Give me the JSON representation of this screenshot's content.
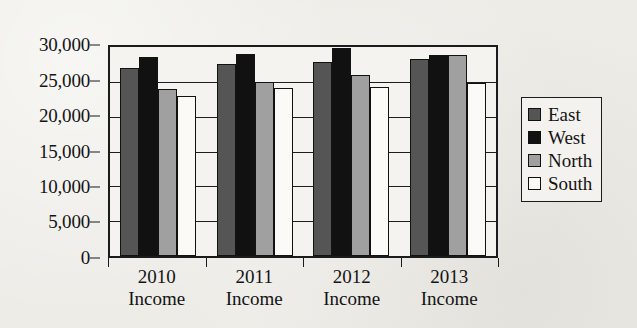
{
  "chart_data": {
    "type": "bar",
    "title": "",
    "subtitle": "",
    "xlabel": "",
    "ylabel": "",
    "categories": [
      "2010 Income",
      "2011 Income",
      "2012 Income",
      "2013 Income"
    ],
    "category_lines": [
      [
        "2010",
        "Income"
      ],
      [
        "2011",
        "Income"
      ],
      [
        "2012",
        "Income"
      ],
      [
        "2013",
        "Income"
      ]
    ],
    "series": [
      {
        "name": "East",
        "color": "#555555",
        "values": [
          27000,
          27600,
          27900,
          28300
        ]
      },
      {
        "name": "West",
        "color": "#111111",
        "values": [
          28500,
          29000,
          29900,
          28900
        ]
      },
      {
        "name": "North",
        "color": "#a0a0a0",
        "values": [
          24000,
          25000,
          26000,
          28900
        ]
      },
      {
        "name": "South",
        "color": "#fbfaf7",
        "values": [
          23000,
          24100,
          24200,
          24800
        ]
      }
    ],
    "ylim": [
      0,
      30000
    ],
    "ytick_values": [
      0,
      5000,
      10000,
      15000,
      20000,
      25000,
      30000
    ],
    "ytick_labels": [
      "0",
      "5,000",
      "10,000",
      "15,000",
      "20,000",
      "25,000",
      "30,000"
    ],
    "grid": true,
    "grid_axis": "y",
    "legend_position": "right",
    "legend_entries": [
      "East",
      "West",
      "North",
      "South"
    ]
  },
  "legend": {
    "items": [
      {
        "label": "East"
      },
      {
        "label": "West"
      },
      {
        "label": "North"
      },
      {
        "label": "South"
      }
    ]
  }
}
